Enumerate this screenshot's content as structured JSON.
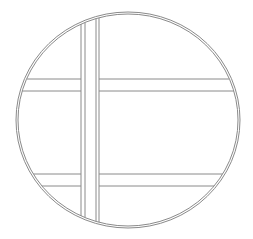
{
  "diagram": {
    "background": "#ffffff",
    "stroke_color": "#8a8a8a",
    "circle": {
      "cx": 128,
      "cy": 120,
      "rx": 112,
      "ry": 108
    },
    "vertical_strips": [
      {
        "x1": 81,
        "x2": 85
      },
      {
        "x1": 96,
        "x2": 99
      }
    ],
    "horizontal_strips": [
      {
        "y1": 79,
        "y2": 91
      },
      {
        "y1": 174,
        "y2": 186
      }
    ]
  }
}
